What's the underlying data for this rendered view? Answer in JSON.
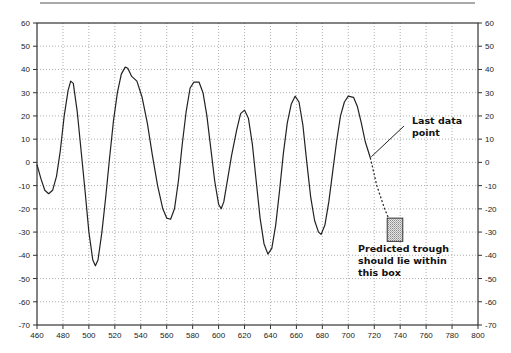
{
  "chart_data": {
    "type": "line",
    "title": "",
    "xlabel": "",
    "ylabel": "",
    "xlim": [
      460,
      800
    ],
    "ylim": [
      -70,
      60
    ],
    "x_ticks": [
      460,
      480,
      500,
      520,
      540,
      560,
      580,
      600,
      620,
      640,
      660,
      680,
      700,
      720,
      740,
      760,
      780,
      800
    ],
    "y_ticks": [
      60,
      50,
      40,
      30,
      20,
      10,
      0,
      -10,
      -20,
      -30,
      -40,
      -50,
      -60,
      -70
    ],
    "y_axis_right_mirror": true,
    "grid": "dotted",
    "legend": "none",
    "series": [
      {
        "name": "data",
        "style": "solid",
        "color": "#222222",
        "points": [
          [
            460,
            -1
          ],
          [
            463,
            -7
          ],
          [
            466,
            -12
          ],
          [
            469,
            -13.5
          ],
          [
            472,
            -12
          ],
          [
            475,
            -6
          ],
          [
            478,
            5
          ],
          [
            481,
            20
          ],
          [
            484,
            31
          ],
          [
            486,
            35
          ],
          [
            488,
            34
          ],
          [
            491,
            22
          ],
          [
            494,
            5
          ],
          [
            497,
            -12
          ],
          [
            500,
            -30
          ],
          [
            503,
            -42
          ],
          [
            505,
            -44.5
          ],
          [
            507,
            -42
          ],
          [
            510,
            -30
          ],
          [
            513,
            -15
          ],
          [
            516,
            2
          ],
          [
            519,
            18
          ],
          [
            522,
            30
          ],
          [
            525,
            38
          ],
          [
            528,
            41
          ],
          [
            530,
            40.5
          ],
          [
            533,
            37
          ],
          [
            537,
            35
          ],
          [
            541,
            28
          ],
          [
            545,
            17
          ],
          [
            549,
            3
          ],
          [
            553,
            -10
          ],
          [
            557,
            -20
          ],
          [
            560,
            -24
          ],
          [
            563,
            -24.5
          ],
          [
            566,
            -20
          ],
          [
            569,
            -8
          ],
          [
            572,
            8
          ],
          [
            575,
            22
          ],
          [
            578,
            32
          ],
          [
            581,
            34.5
          ],
          [
            585,
            34.5
          ],
          [
            588,
            30
          ],
          [
            591,
            20
          ],
          [
            594,
            6
          ],
          [
            597,
            -8
          ],
          [
            600,
            -18
          ],
          [
            602,
            -20
          ],
          [
            604,
            -17
          ],
          [
            607,
            -7
          ],
          [
            610,
            3
          ],
          [
            614,
            14
          ],
          [
            617,
            21
          ],
          [
            620,
            22.5
          ],
          [
            623,
            19
          ],
          [
            626,
            8
          ],
          [
            629,
            -8
          ],
          [
            632,
            -24
          ],
          [
            635,
            -35
          ],
          [
            638,
            -39.5
          ],
          [
            641,
            -37
          ],
          [
            644,
            -27
          ],
          [
            647,
            -12
          ],
          [
            650,
            4
          ],
          [
            653,
            17
          ],
          [
            656,
            25
          ],
          [
            659,
            28.5
          ],
          [
            662,
            26
          ],
          [
            665,
            16
          ],
          [
            668,
            0
          ],
          [
            671,
            -15
          ],
          [
            674,
            -25
          ],
          [
            677,
            -30
          ],
          [
            679,
            -31
          ],
          [
            682,
            -27
          ],
          [
            685,
            -17
          ],
          [
            688,
            -4
          ],
          [
            691,
            9
          ],
          [
            694,
            20
          ],
          [
            697,
            26
          ],
          [
            700,
            28.5
          ],
          [
            704,
            28
          ],
          [
            707,
            24
          ],
          [
            710,
            17
          ],
          [
            713,
            9
          ],
          [
            717,
            2
          ]
        ]
      },
      {
        "name": "projection",
        "style": "dashed",
        "color": "#222222",
        "points": [
          [
            717,
            2
          ],
          [
            722,
            -10
          ],
          [
            728,
            -20
          ],
          [
            731,
            -24
          ]
        ]
      }
    ],
    "annotations": [
      {
        "text_lines": [
          "Last data",
          "point"
        ],
        "target": [
          717,
          2
        ],
        "text_position": [
          737,
          16
        ],
        "leader_line": true
      },
      {
        "text_lines": [
          "Predicted trough",
          "should lie within",
          "this box"
        ],
        "text_position": [
          713,
          -38
        ]
      }
    ],
    "prediction_box": {
      "x0": 730,
      "x1": 742,
      "y0": -34,
      "y1": -24,
      "fill": "stippled gray"
    }
  },
  "labels": {
    "last_point_line1": "Last data",
    "last_point_line2": "point",
    "pred_line1": "Predicted trough",
    "pred_line2": "should lie within",
    "pred_line3": "this box"
  }
}
